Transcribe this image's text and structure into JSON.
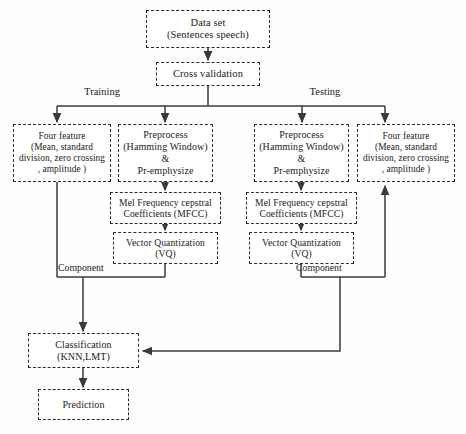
{
  "diagram": {
    "width": 466,
    "height": 434,
    "colors": {
      "node_border": "#2b2b2b",
      "node_fill": "#ffffff",
      "connector": "#3a3a3a",
      "text": "#1a1a1a",
      "background": "#fefefe"
    }
  },
  "nodes": {
    "dataset": {
      "line1": "Data set",
      "line2": "(Sentences speech)"
    },
    "crossval": {
      "line1": "Cross validation",
      "line2": ""
    },
    "feature_left": {
      "line1": "Four feature",
      "line2": "(Mean, standard",
      "line3": "division, zero crossing",
      "line4": ", amplitude )"
    },
    "preprocess_left": {
      "line1": "Preprocess",
      "line2": "(Hamming Window)",
      "line3": "&",
      "line4": "Pr-emphysize"
    },
    "preprocess_right": {
      "line1": "Preprocess",
      "line2": "(Hamming Window)",
      "line3": "&",
      "line4": "Pr-emphysize"
    },
    "feature_right": {
      "line1": "Four feature",
      "line2": "(Mean, standard",
      "line3": "division, zero crossing",
      "line4": ", amplitude )"
    },
    "mfcc_left": {
      "line1": "Mel Frequency cepstral",
      "line2": "Coefficients (MFCC)"
    },
    "mfcc_right": {
      "line1": "Mel Frequency cepstral",
      "line2": "Coefficients (MFCC)"
    },
    "vq_left": {
      "line1": "Vector Quantization",
      "line2": "(VQ)"
    },
    "vq_right": {
      "line1": "Vector Quantization",
      "line2": "(VQ)"
    },
    "classification": {
      "line1": "Classification",
      "line2": "(KNN,LMT)"
    },
    "prediction": {
      "line1": "Prediction",
      "line2": ""
    }
  },
  "edge_labels": {
    "training": "Training",
    "testing": "Testing",
    "component_left": "Component",
    "component_right": "Component"
  }
}
